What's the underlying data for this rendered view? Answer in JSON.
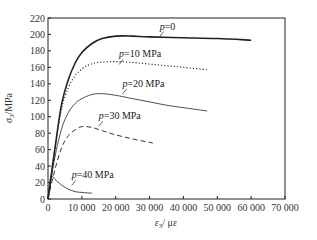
{
  "chart_data": {
    "type": "line",
    "title": "",
    "xlabel": "ε3/ με",
    "ylabel": "σ3/MPa",
    "xlim": [
      0,
      70000
    ],
    "ylim": [
      0,
      220
    ],
    "xticks": [
      0,
      10000,
      20000,
      30000,
      40000,
      50000,
      60000,
      70000
    ],
    "xtick_labels": [
      "0",
      "10 000",
      "20 000",
      "30 000",
      "40 000",
      "50 000",
      "60 000",
      "70 000"
    ],
    "yticks": [
      0,
      20,
      40,
      60,
      80,
      100,
      120,
      140,
      160,
      180,
      200,
      220
    ],
    "ytick_labels": [
      "0",
      "20",
      "40",
      "60",
      "80",
      "100",
      "120",
      "140",
      "160",
      "180",
      "200",
      "220"
    ],
    "grid": false,
    "legend": "inline labels",
    "series": [
      {
        "name": "p=0",
        "style": "solid-thick",
        "label": "p=0",
        "x": [
          0,
          2000,
          4000,
          6000,
          8000,
          10000,
          13000,
          16000,
          20000,
          25000,
          30000,
          40000,
          50000,
          60000
        ],
        "y": [
          0,
          60,
          115,
          145,
          165,
          178,
          189,
          195,
          198,
          198,
          197,
          196,
          195,
          193
        ]
      },
      {
        "name": "p=10 MPa",
        "style": "dotted",
        "label": "p=10 MPa",
        "x": [
          0,
          2000,
          4000,
          6000,
          8000,
          10000,
          12000,
          15000,
          20000,
          25000,
          30000,
          35000,
          40000,
          47000
        ],
        "y": [
          0,
          60,
          110,
          135,
          150,
          158,
          163,
          166,
          167,
          166,
          164,
          162,
          160,
          157
        ]
      },
      {
        "name": "p=20 MPa",
        "style": "solid-thin",
        "label": "p=20 MPa",
        "x": [
          0,
          2000,
          4000,
          6000,
          8000,
          10000,
          13000,
          16000,
          20000,
          25000,
          30000,
          35000,
          40000,
          47000
        ],
        "y": [
          0,
          50,
          85,
          105,
          116,
          122,
          127,
          128,
          126,
          122,
          118,
          114,
          111,
          107
        ]
      },
      {
        "name": "p=30 MPa",
        "style": "dashed",
        "label": "p=30 MPa",
        "x": [
          0,
          2000,
          4000,
          6000,
          8000,
          10000,
          13000,
          16000,
          20000,
          25000,
          31000
        ],
        "y": [
          0,
          35,
          62,
          77,
          84,
          88,
          87,
          83,
          78,
          73,
          68
        ]
      },
      {
        "name": "p=40 MPa",
        "style": "solid-thin",
        "label": "p=40 MPa",
        "x": [
          0,
          500,
          1000,
          2000,
          4000,
          6000,
          8000,
          10000,
          13000
        ],
        "y": [
          0,
          20,
          28,
          24,
          17,
          12,
          9,
          8,
          7
        ]
      }
    ],
    "annotations": [
      {
        "text": "p=0",
        "x": 33000,
        "y": 206
      },
      {
        "text": "p=10 MPa",
        "x": 21000,
        "y": 172
      },
      {
        "text": "p=20 MPa",
        "x": 22000,
        "y": 136
      },
      {
        "text": "p=30 MPa",
        "x": 15000,
        "y": 97
      },
      {
        "text": "p=40 MPa",
        "x": 7000,
        "y": 25
      }
    ]
  }
}
